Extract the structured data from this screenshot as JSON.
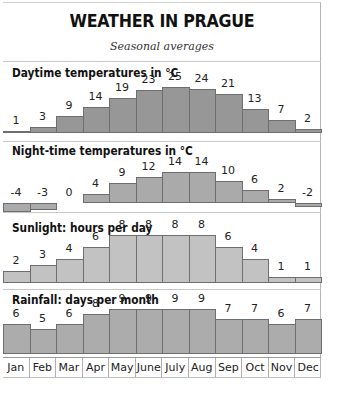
{
  "header": {
    "title": "WEATHER IN PRAGUE",
    "subtitle": "Seasonal averages"
  },
  "months": [
    "Jan",
    "Feb",
    "Mar",
    "Apr",
    "May",
    "June",
    "July",
    "Aug",
    "Sep",
    "Oct",
    "Nov",
    "Dec"
  ],
  "panels": [
    {
      "title": "Daytime temperatures in °C",
      "values": [
        1,
        3,
        9,
        14,
        19,
        23,
        25,
        24,
        21,
        13,
        7,
        2
      ]
    },
    {
      "title": "Night-time temperatures in °C",
      "values": [
        -4,
        -3,
        0,
        4,
        9,
        12,
        14,
        14,
        10,
        6,
        2,
        -2
      ]
    },
    {
      "title": "Sunlight: hours per day",
      "values": [
        2,
        3,
        4,
        6,
        8,
        8,
        8,
        8,
        6,
        4,
        1,
        1
      ]
    },
    {
      "title": "Rainfall: days per month",
      "values": [
        6,
        5,
        6,
        8,
        9,
        9,
        9,
        9,
        7,
        7,
        6,
        7
      ]
    }
  ],
  "colors": {
    "daytime": "#979797",
    "night": "#aaaaaa",
    "sunlight": "#c2c2c2",
    "rainfall": "#acacac",
    "outline": "#6e6e6e"
  },
  "chart_data": [
    {
      "type": "bar",
      "title": "Daytime temperatures in °C",
      "categories": [
        "Jan",
        "Feb",
        "Mar",
        "Apr",
        "May",
        "June",
        "July",
        "Aug",
        "Sep",
        "Oct",
        "Nov",
        "Dec"
      ],
      "values": [
        1,
        3,
        9,
        14,
        19,
        23,
        25,
        24,
        21,
        13,
        7,
        2
      ],
      "xlabel": "",
      "ylabel": "°C",
      "grid": false,
      "data_labels": true
    },
    {
      "type": "bar",
      "title": "Night-time temperatures in °C",
      "categories": [
        "Jan",
        "Feb",
        "Mar",
        "Apr",
        "May",
        "June",
        "July",
        "Aug",
        "Sep",
        "Oct",
        "Nov",
        "Dec"
      ],
      "values": [
        -4,
        -3,
        0,
        4,
        9,
        12,
        14,
        14,
        10,
        6,
        2,
        -2
      ],
      "xlabel": "",
      "ylabel": "°C",
      "grid": false,
      "data_labels": true
    },
    {
      "type": "bar",
      "title": "Sunlight: hours per day",
      "categories": [
        "Jan",
        "Feb",
        "Mar",
        "Apr",
        "May",
        "June",
        "July",
        "Aug",
        "Sep",
        "Oct",
        "Nov",
        "Dec"
      ],
      "values": [
        2,
        3,
        4,
        6,
        8,
        8,
        8,
        8,
        6,
        4,
        1,
        1
      ],
      "xlabel": "",
      "ylabel": "hours",
      "grid": false,
      "data_labels": true
    },
    {
      "type": "bar",
      "title": "Rainfall: days per month",
      "categories": [
        "Jan",
        "Feb",
        "Mar",
        "Apr",
        "May",
        "June",
        "July",
        "Aug",
        "Sep",
        "Oct",
        "Nov",
        "Dec"
      ],
      "values": [
        6,
        5,
        6,
        8,
        9,
        9,
        9,
        9,
        7,
        7,
        6,
        7
      ],
      "xlabel": "",
      "ylabel": "days",
      "grid": false,
      "data_labels": true
    }
  ]
}
